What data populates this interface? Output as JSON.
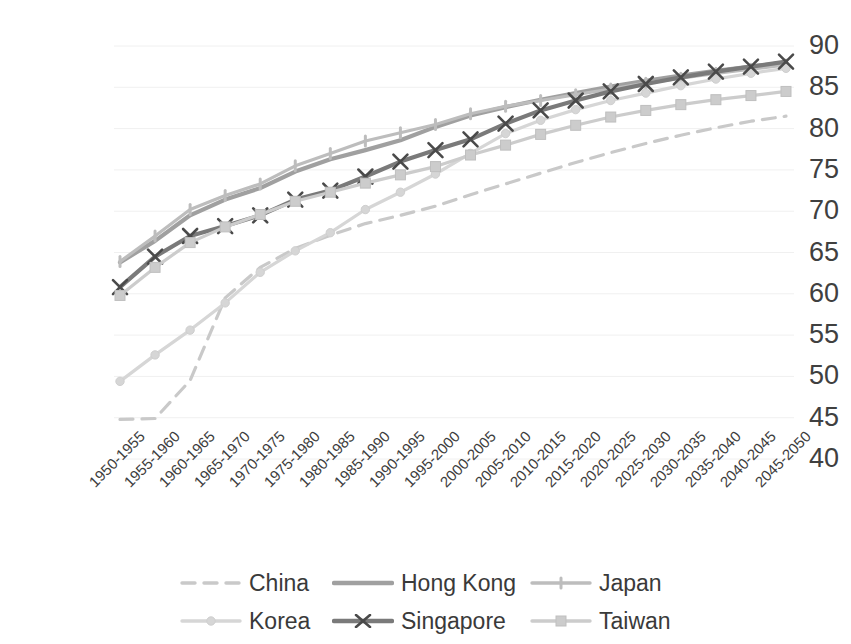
{
  "chart_data": {
    "type": "line",
    "title": "",
    "xlabel": "",
    "ylabel": "",
    "ylim": [
      40,
      90
    ],
    "y_ticks": [
      40,
      45,
      50,
      55,
      60,
      65,
      70,
      75,
      80,
      85,
      90
    ],
    "grid": true,
    "legend_position": "bottom",
    "categories": [
      "1950-1955",
      "1955-1960",
      "1960-1965",
      "1965-1970",
      "1970-1975",
      "1975-1980",
      "1980-1985",
      "1985-1990",
      "1990-1995",
      "1995-2000",
      "2000-2005",
      "2005-2010",
      "2010-2015",
      "2015-2020",
      "2020-2025",
      "2025-2030",
      "2030-2035",
      "2035-2040",
      "2040-2045",
      "2045-2050"
    ],
    "series": [
      {
        "name": "China",
        "color": "#c9c9c9",
        "style": "dashed",
        "marker": "none",
        "values": [
          44.8,
          44.9,
          49.5,
          59.5,
          63.2,
          65.5,
          67.1,
          68.5,
          69.5,
          70.6,
          72.0,
          73.3,
          74.6,
          75.9,
          77.1,
          78.2,
          79.2,
          80.1,
          80.9,
          81.5
        ]
      },
      {
        "name": "Hong Kong",
        "color": "#a0a0a0",
        "style": "solid",
        "marker": "none",
        "values": [
          63.8,
          66.4,
          69.5,
          71.4,
          72.8,
          74.8,
          76.3,
          77.4,
          78.6,
          80.2,
          81.6,
          82.6,
          83.5,
          84.3,
          85.1,
          85.8,
          86.4,
          87.0,
          87.5,
          88.0
        ]
      },
      {
        "name": "Japan",
        "color": "#bdbdbd",
        "style": "solid",
        "marker": "tick",
        "values": [
          63.9,
          67.0,
          70.2,
          71.9,
          73.3,
          75.5,
          77.0,
          78.5,
          79.5,
          80.5,
          81.8,
          82.7,
          83.4,
          84.1,
          84.8,
          85.5,
          86.1,
          86.7,
          87.2,
          87.7
        ]
      },
      {
        "name": "Korea",
        "color": "#d6d6d6",
        "style": "solid",
        "marker": "circle",
        "values": [
          49.4,
          52.6,
          55.6,
          58.9,
          62.6,
          65.2,
          67.4,
          70.2,
          72.3,
          74.5,
          77.0,
          79.4,
          81.0,
          82.3,
          83.4,
          84.3,
          85.2,
          86.0,
          86.7,
          87.3
        ]
      },
      {
        "name": "Singapore",
        "color": "#7a7a7a",
        "style": "solid",
        "marker": "x",
        "values": [
          60.8,
          64.5,
          67.0,
          68.2,
          69.5,
          71.4,
          72.5,
          74.2,
          76.0,
          77.4,
          78.7,
          80.6,
          82.2,
          83.4,
          84.5,
          85.4,
          86.2,
          86.9,
          87.5,
          88.1
        ]
      },
      {
        "name": "Taiwan",
        "color": "#cccccc",
        "style": "solid",
        "marker": "square",
        "values": [
          59.8,
          63.2,
          66.2,
          68.1,
          69.6,
          71.2,
          72.3,
          73.4,
          74.4,
          75.4,
          76.8,
          78.0,
          79.3,
          80.4,
          81.4,
          82.2,
          82.9,
          83.5,
          84.0,
          84.5
        ]
      }
    ]
  },
  "axis": {
    "y_labels": [
      "90",
      "85",
      "80",
      "75",
      "70",
      "65",
      "60",
      "55",
      "50",
      "45",
      "40"
    ]
  },
  "legend": {
    "rows": [
      [
        {
          "name": "China",
          "label": "China"
        },
        {
          "name": "Hong Kong",
          "label": "Hong Kong"
        },
        {
          "name": "Japan",
          "label": "Japan"
        }
      ],
      [
        {
          "name": "Korea",
          "label": "Korea"
        },
        {
          "name": "Singapore",
          "label": "Singapore"
        },
        {
          "name": "Taiwan",
          "label": "Taiwan"
        }
      ]
    ]
  }
}
